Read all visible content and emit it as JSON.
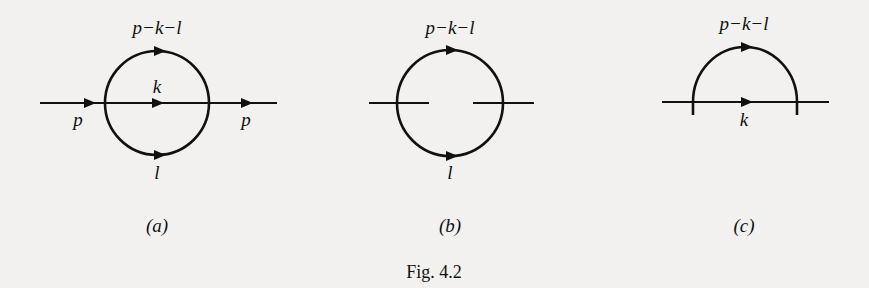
{
  "figure": {
    "caption": "Fig. 4.2",
    "panels": [
      {
        "id": "a",
        "sublabel": "(a)",
        "labels": {
          "top": "p−k−l",
          "middle": "k",
          "bottom": "l",
          "left": "p",
          "right": "p"
        }
      },
      {
        "id": "b",
        "sublabel": "(b)",
        "labels": {
          "top": "p−k−l",
          "bottom": "l"
        }
      },
      {
        "id": "c",
        "sublabel": "(c)",
        "labels": {
          "top": "p−k−l",
          "bottom": "k"
        }
      }
    ]
  },
  "colors": {
    "background": "#f2f1ef",
    "ink": "#111111"
  }
}
